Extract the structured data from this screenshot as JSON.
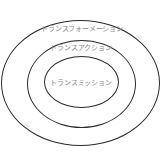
{
  "diagram": {
    "type": "concentric-ellipses",
    "layers": [
      {
        "label": "トランスフォーメーション",
        "level": "outer"
      },
      {
        "label": "トランスアクション",
        "level": "middle"
      },
      {
        "label": "トランスミッション",
        "level": "inner"
      }
    ],
    "colors": {
      "stroke": "#2b2b2b",
      "text": "#8a8a8a",
      "background": "#ffffff"
    }
  }
}
